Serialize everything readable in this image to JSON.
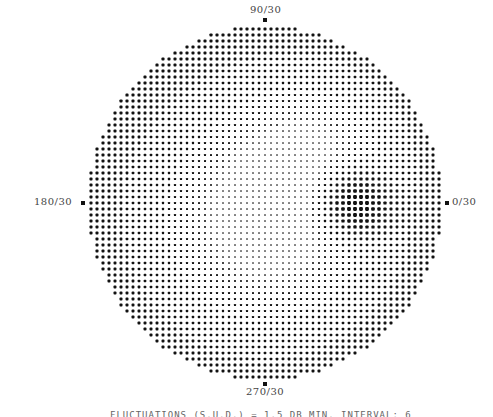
{
  "chart_data": {
    "type": "heatmap",
    "subtype": "perimetry-greyscale",
    "field_extent_degrees": 30,
    "meridian_labels": {
      "top": "90/30",
      "bottom": "270/30",
      "left": "180/30",
      "right": "0/30"
    },
    "density_description": "Dense dark dots throughout periphery; lighter central and inferior-central area; dark scotoma blob right of center near 0 degree meridian",
    "features": [
      {
        "name": "dark-spot",
        "meridian_deg": 0,
        "eccentricity_deg": 15,
        "radius_deg": 4,
        "intensity": 1.0
      },
      {
        "name": "light-central-region",
        "meridian_deg": 270,
        "eccentricity_deg": 5,
        "radius_deg": 14,
        "intensity": -0.45
      },
      {
        "name": "light-upper-right",
        "meridian_deg": 45,
        "eccentricity_deg": 14,
        "radius_deg": 10,
        "intensity": -0.3
      }
    ],
    "grid_on": false,
    "legend": "none"
  },
  "caption": "FLUCTUATIONS (S.U.D.) = 1.5 DB     MIN. INTERVAL: 6"
}
